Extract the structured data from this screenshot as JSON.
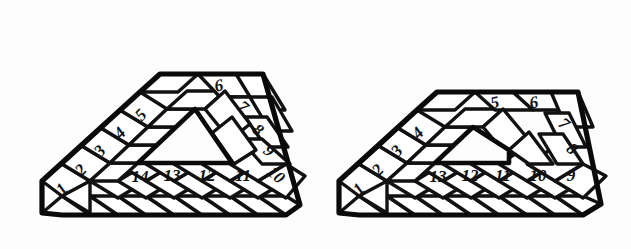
{
  "figure_pair": {
    "description": "Two hand-drawn isometric trapezoidal frame puzzles with numbered rhombic tiles",
    "background_color": "#fdfdfd",
    "ink_color": "#111111"
  },
  "figures": [
    {
      "id": "left-figure",
      "name": "left-triangular-frame",
      "left_column_numbers": [
        "1",
        "2",
        "3",
        "4",
        "5"
      ],
      "top_row_numbers": [
        "6"
      ],
      "right_column_numbers": [
        "7",
        "8",
        "9",
        "10"
      ],
      "bottom_row_numbers": [
        "11",
        "12",
        "13",
        "14"
      ],
      "numbers_in_reading_order": [
        "1",
        "2",
        "3",
        "4",
        "5",
        "6",
        "7",
        "8",
        "9",
        "10",
        "11",
        "12",
        "13",
        "14"
      ],
      "tile_count": 14,
      "has_interior_triangular_hole": true
    },
    {
      "id": "right-figure",
      "name": "right-trapezoidal-frame",
      "left_column_numbers": [
        "1",
        "2",
        "3",
        "4"
      ],
      "top_row_numbers": [
        "5",
        "6"
      ],
      "right_column_numbers": [
        "7",
        "8",
        "9"
      ],
      "bottom_row_numbers": [
        "10",
        "11",
        "12",
        "13"
      ],
      "numbers_in_reading_order": [
        "1",
        "2",
        "3",
        "4",
        "5",
        "6",
        "7",
        "8",
        "9",
        "10",
        "11",
        "12",
        "13"
      ],
      "tile_count": 13,
      "has_interior_triangular_hole": false
    }
  ],
  "left_labels": {
    "n1": "1",
    "n2": "2",
    "n3": "3",
    "n4": "4",
    "n5": "5",
    "n6": "6",
    "n7": "7",
    "n8": "8",
    "n9": "9",
    "n10": "10",
    "n11": "11",
    "n12": "12",
    "n13": "13",
    "n14": "14"
  },
  "right_labels": {
    "n1": "1",
    "n2": "2",
    "n3": "3",
    "n4": "4",
    "n5": "5",
    "n6": "6",
    "n7": "7",
    "n8": "8",
    "n9": "9",
    "n10": "10",
    "n11": "11",
    "n12": "12",
    "n13": "13"
  }
}
